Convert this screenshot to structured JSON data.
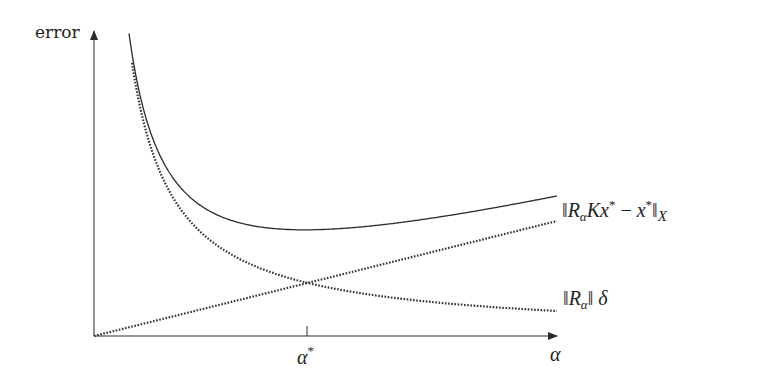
{
  "chart_data": {
    "type": "line",
    "title": "",
    "xlabel": "α",
    "ylabel": "error",
    "x_ticks": [
      {
        "position": "alpha_star",
        "label": "α*"
      }
    ],
    "grid": false,
    "legend": "inline labels at right end of curves",
    "series": [
      {
        "name": "total error",
        "label": "‖RαKx* − x*‖X",
        "style": "solid",
        "shape": "U-shaped: steep decrease then slow increase, minimum at α*",
        "description": "sum of the two component curves"
      },
      {
        "name": "approximation error (increasing)",
        "label_parts": "‖RαKx* − x*‖X (dotted, linear increase)",
        "style": "dotted",
        "shape": "straight line rising from origin"
      },
      {
        "name": "data error",
        "label": "‖Rα‖ δ",
        "style": "dotted",
        "shape": "hyperbolic decrease"
      }
    ],
    "annotations": [
      "curves cross at α*",
      "total error minimized at α*"
    ]
  },
  "axes": {
    "y_label": "error",
    "x_label": "α",
    "tick_label": "α",
    "tick_sup": "*"
  },
  "labels": {
    "top_curve": {
      "open": "‖",
      "R": "R",
      "sub": "α",
      "K": "K",
      "x1": "x",
      "star1": "*",
      "minus": "−",
      "x2": "x",
      "star2": "*",
      "close": "‖",
      "space": "X"
    },
    "bottom_curve": {
      "open": "‖",
      "R": "R",
      "sub": "α",
      "close": "‖",
      "delta": "δ"
    }
  },
  "geometry": {
    "origin": [
      94,
      336
    ],
    "y_axis_top": 31,
    "x_axis_end": 557,
    "alpha_star_x": 307,
    "linear_end": [
      557,
      221
    ],
    "hyperbola": {
      "A": 11448,
      "x0": 90,
      "B": 0.5
    },
    "solid_top_y": 30,
    "dotted_top_y": 58,
    "curve_end_x": 557
  },
  "colors": {
    "ink": "#2b2b2b",
    "dots": "#333333"
  }
}
